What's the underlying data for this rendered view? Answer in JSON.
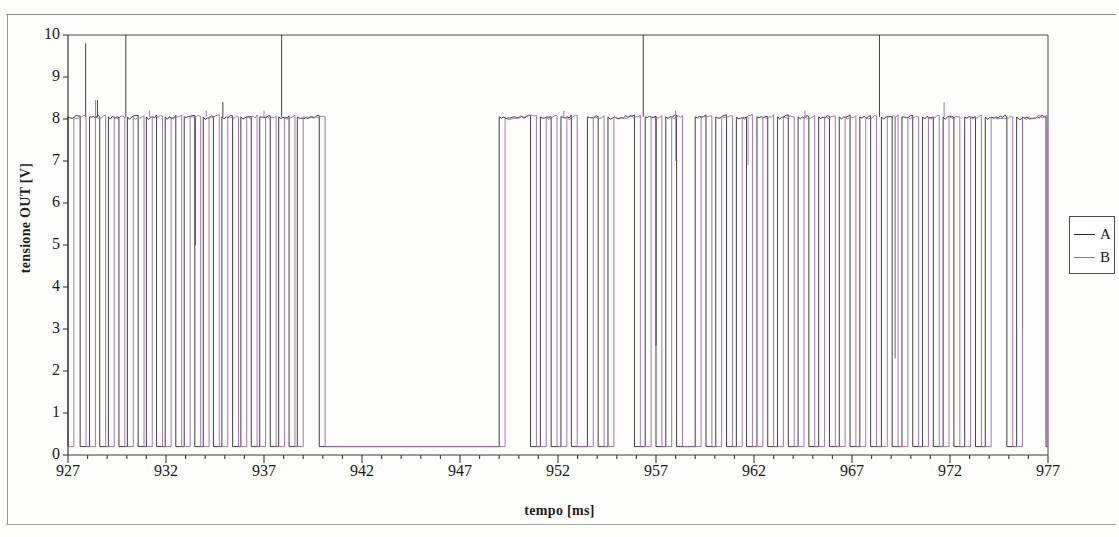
{
  "chart_data": {
    "type": "line",
    "title": "",
    "subtitle": "",
    "xlabel": "tempo [ms]",
    "ylabel": "tensione OUT [V]",
    "xlim": [
      927,
      977
    ],
    "ylim": [
      0,
      10
    ],
    "xticks": [
      927,
      932,
      937,
      942,
      947,
      952,
      957,
      962,
      967,
      972,
      977
    ],
    "xtick_labels": [
      "927",
      "932",
      "937",
      "942",
      "947",
      "952",
      "957",
      "962",
      "967",
      "972",
      "977"
    ],
    "xtick_minor_step": 1,
    "yticks": [
      0,
      1,
      2,
      3,
      4,
      5,
      6,
      7,
      8,
      9,
      10
    ],
    "ytick_labels": [
      "0",
      "1",
      "2",
      "3",
      "4",
      "5",
      "6",
      "7",
      "8",
      "9",
      "10"
    ],
    "grid": false,
    "legend_position": "right-outside",
    "v_low": 0.2,
    "v_high": 8.05,
    "series": [
      {
        "name": "A",
        "color": "#2a2a2a",
        "linewidth": 0.9,
        "pulses": [
          [
            927.0,
            927.62
          ],
          [
            928.1,
            928.62
          ],
          [
            929.06,
            929.6
          ],
          [
            930.03,
            930.58
          ],
          [
            931.0,
            931.52
          ],
          [
            931.96,
            932.5
          ],
          [
            932.93,
            933.47
          ],
          [
            933.9,
            934.42
          ],
          [
            934.85,
            935.4
          ],
          [
            935.82,
            936.35
          ],
          [
            936.78,
            937.32
          ],
          [
            937.75,
            938.28
          ],
          [
            938.7,
            939.82
          ],
          [
            949.0,
            950.6
          ],
          [
            951.1,
            951.65
          ],
          [
            952.15,
            952.68
          ],
          [
            953.5,
            954.05
          ],
          [
            954.55,
            955.9
          ],
          [
            956.45,
            957.0
          ],
          [
            957.5,
            958.05
          ],
          [
            959.0,
            959.55
          ],
          [
            960.05,
            960.6
          ],
          [
            961.1,
            961.62
          ],
          [
            962.15,
            962.7
          ],
          [
            963.2,
            963.75
          ],
          [
            964.25,
            964.8
          ],
          [
            965.3,
            965.85
          ],
          [
            966.35,
            966.9
          ],
          [
            967.4,
            967.95
          ],
          [
            968.5,
            969.05
          ],
          [
            969.55,
            970.1
          ],
          [
            970.6,
            971.15
          ],
          [
            971.65,
            972.2
          ],
          [
            972.75,
            973.3
          ],
          [
            973.8,
            974.9
          ],
          [
            975.4,
            976.9
          ]
        ],
        "spikes": [
          [
            927.9,
            9.8
          ],
          [
            929.95,
            10.0
          ],
          [
            937.9,
            10.0
          ],
          [
            956.35,
            10.0
          ],
          [
            968.4,
            10.0
          ],
          [
            928.5,
            8.45
          ],
          [
            934.9,
            8.4
          ]
        ],
        "droops": [
          [
            933.5,
            5.0
          ],
          [
            957.0,
            2.6
          ],
          [
            969.2,
            2.3
          ],
          [
            975.7,
            3.0
          ]
        ]
      },
      {
        "name": "B",
        "color": "#9c69ad",
        "linewidth": 0.9,
        "pulses": [
          [
            927.3,
            927.92
          ],
          [
            928.4,
            928.92
          ],
          [
            929.36,
            929.9
          ],
          [
            930.33,
            930.88
          ],
          [
            931.3,
            931.82
          ],
          [
            932.26,
            932.8
          ],
          [
            933.23,
            933.77
          ],
          [
            934.2,
            934.72
          ],
          [
            935.15,
            935.7
          ],
          [
            936.12,
            936.65
          ],
          [
            937.08,
            937.62
          ],
          [
            938.05,
            938.58
          ],
          [
            939.0,
            940.12
          ],
          [
            949.3,
            950.9
          ],
          [
            951.4,
            951.95
          ],
          [
            952.45,
            952.98
          ],
          [
            953.8,
            954.35
          ],
          [
            954.85,
            956.2
          ],
          [
            956.75,
            957.3
          ],
          [
            957.8,
            958.35
          ],
          [
            959.3,
            959.85
          ],
          [
            960.35,
            960.9
          ],
          [
            961.4,
            961.92
          ],
          [
            962.45,
            963.0
          ],
          [
            963.5,
            964.05
          ],
          [
            964.55,
            965.1
          ],
          [
            965.6,
            966.15
          ],
          [
            966.65,
            967.2
          ],
          [
            967.7,
            968.25
          ],
          [
            968.8,
            969.35
          ],
          [
            969.85,
            970.4
          ],
          [
            970.9,
            971.45
          ],
          [
            971.95,
            972.5
          ],
          [
            973.05,
            973.6
          ],
          [
            974.1,
            975.2
          ],
          [
            975.7,
            976.95
          ]
        ],
        "spikes": [
          [
            928.4,
            8.45
          ],
          [
            931.15,
            8.2
          ],
          [
            934.05,
            8.2
          ],
          [
            937.0,
            8.2
          ],
          [
            952.3,
            8.2
          ],
          [
            958.0,
            8.2
          ],
          [
            964.6,
            8.2
          ],
          [
            971.7,
            8.4
          ]
        ],
        "droops": [
          [
            958.0,
            7.0
          ],
          [
            961.7,
            6.9
          ]
        ]
      }
    ]
  },
  "legend": {
    "entries": [
      {
        "label": "A",
        "color": "#2a2a2a"
      },
      {
        "label": "B",
        "color": "#9c69ad"
      }
    ]
  }
}
